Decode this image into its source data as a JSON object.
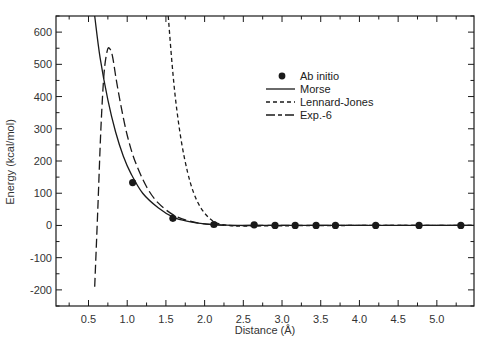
{
  "chart_data": {
    "type": "line",
    "title": "",
    "xlabel": "Distance (Å)",
    "ylabel": "Energy (kcal/mol)",
    "xlim": [
      0.08,
      5.48
    ],
    "ylim": [
      -250,
      650
    ],
    "x_ticks": [
      0.5,
      1.0,
      1.5,
      2.0,
      2.5,
      3.0,
      3.5,
      4.0,
      4.5,
      5.0
    ],
    "x_tick_labels": [
      "0.5",
      "1.0",
      "1.5",
      "2.0",
      "2.5",
      "3.0",
      "3.5",
      "4.0",
      "4.5",
      "5.0"
    ],
    "y_ticks": [
      -200,
      -100,
      0,
      100,
      200,
      300,
      400,
      500,
      600
    ],
    "y_tick_labels": [
      "-200",
      "-100",
      "0",
      "100",
      "200",
      "300",
      "400",
      "500",
      "600"
    ],
    "grid": false,
    "legend_position": "upper right (inside plot)",
    "legend": [
      "Ab initio",
      "Morse",
      "Lennard-Jones",
      "Exp.-6"
    ],
    "series": [
      {
        "name": "Ab initio",
        "style": "markers",
        "x": [
          1.07,
          1.59,
          2.12,
          2.64,
          2.91,
          3.17,
          3.44,
          3.69,
          4.21,
          4.77,
          5.31
        ],
        "y": [
          133,
          22,
          3,
          2,
          0,
          0,
          0,
          0,
          0,
          0,
          0
        ]
      },
      {
        "name": "Morse",
        "style": "solid",
        "x": [
          0.58,
          0.65,
          0.75,
          0.85,
          0.95,
          1.05,
          1.2,
          1.4,
          1.6,
          1.8,
          2.0,
          2.2,
          2.5,
          3.0,
          4.0,
          5.48
        ],
        "y": [
          650,
          520,
          390,
          290,
          215,
          160,
          100,
          55,
          25,
          12,
          5,
          2,
          0,
          0,
          0,
          0
        ]
      },
      {
        "name": "Lennard-Jones",
        "style": "dashed",
        "x": [
          1.53,
          1.58,
          1.63,
          1.7,
          1.78,
          1.86,
          1.95,
          2.05,
          2.15,
          2.3,
          2.5,
          3.0,
          4.0,
          5.48
        ],
        "y": [
          650,
          500,
          380,
          260,
          165,
          100,
          55,
          25,
          8,
          0,
          -2,
          -1,
          0,
          0
        ]
      },
      {
        "name": "Exp.-6",
        "style": "dash-dot",
        "x": [
          0.58,
          0.62,
          0.66,
          0.7,
          0.74,
          0.77,
          0.81,
          0.86,
          0.92,
          1.0,
          1.1,
          1.25,
          1.4,
          1.6,
          1.8,
          2.0,
          2.3,
          3.0,
          5.48
        ],
        "y": [
          -190,
          50,
          300,
          470,
          540,
          550,
          525,
          450,
          370,
          280,
          200,
          120,
          70,
          32,
          14,
          5,
          0,
          0,
          0
        ]
      }
    ]
  },
  "legend": {
    "items": [
      {
        "label": "Ab initio",
        "marker": "filled-circle"
      },
      {
        "label": "Morse",
        "marker": "solid-line"
      },
      {
        "label": "Lennard-Jones",
        "marker": "dashed-line"
      },
      {
        "label": "Exp.-6",
        "marker": "dash-dot-line"
      }
    ]
  },
  "colors": {
    "ink": "#1a1a1a",
    "background": "#ffffff"
  }
}
